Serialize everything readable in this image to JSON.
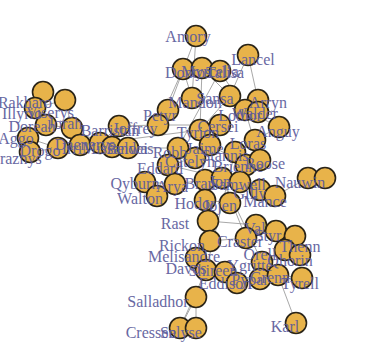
{
  "diagram": {
    "type": "network-graph",
    "node_fill": "#E8B34A",
    "node_stroke": "#2a2418",
    "label_color": "#5b5b9b",
    "edge_color": "#9a9a9a",
    "nodes": [
      {
        "id": "amory",
        "label": "Amory",
        "x": 196,
        "y": 36,
        "lx": 188,
        "ly": 38
      },
      {
        "id": "lancel",
        "label": "Lancel",
        "x": 248,
        "y": 55,
        "lx": 253,
        "ly": 61
      },
      {
        "id": "dontos",
        "label": "Dontos",
        "x": 183,
        "y": 69,
        "lx": 188,
        "ly": 74
      },
      {
        "id": "myrcella",
        "label": "Myrcella",
        "x": 202,
        "y": 68,
        "lx": 210,
        "ly": 73
      },
      {
        "id": "talisa",
        "label": "Talisa",
        "x": 220,
        "y": 71,
        "lx": 225,
        "ly": 74
      },
      {
        "id": "arryn",
        "label": "Arryn",
        "x": 258,
        "y": 100,
        "lx": 268,
        "ly": 104
      },
      {
        "id": "sansa",
        "label": "Sansa",
        "x": 230,
        "y": 96,
        "lx": 215,
        "ly": 100
      },
      {
        "id": "mandon",
        "label": "Mandon",
        "x": 192,
        "y": 98,
        "lx": 195,
        "ly": 104
      },
      {
        "id": "walder",
        "label": "Walder",
        "x": 245,
        "y": 110,
        "lx": 255,
        "ly": 115
      },
      {
        "id": "lothor",
        "label": "Lothor",
        "x": 258,
        "y": 112,
        "lx": 240,
        "ly": 117
      },
      {
        "id": "anguy",
        "label": "Anguy",
        "x": 279,
        "y": 127,
        "lx": 278,
        "ly": 133
      },
      {
        "id": "petyr",
        "label": "Petyr",
        "x": 168,
        "y": 110,
        "lx": 160,
        "ly": 117
      },
      {
        "id": "joffrey",
        "label": "Joffrey",
        "x": 158,
        "y": 125,
        "lx": 135,
        "ly": 130
      },
      {
        "id": "tyrion",
        "label": "Tyrion",
        "x": 200,
        "y": 130,
        "lx": 198,
        "ly": 134
      },
      {
        "id": "cersei",
        "label": "Cersei",
        "x": 220,
        "y": 125,
        "lx": 218,
        "ly": 128
      },
      {
        "id": "jaime",
        "label": "Jaime",
        "x": 210,
        "y": 145,
        "lx": 205,
        "ly": 150
      },
      {
        "id": "rakharo",
        "label": "Rakharo",
        "x": 43,
        "y": 92,
        "lx": 25,
        "ly": 104
      },
      {
        "id": "illyrio",
        "label": "Illyrio",
        "x": 35,
        "y": 108,
        "lx": 22,
        "ly": 115
      },
      {
        "id": "viserys",
        "label": "Viserys",
        "x": 65,
        "y": 100,
        "lx": 50,
        "ly": 114
      },
      {
        "id": "doreah",
        "label": "Doreah",
        "x": 46,
        "y": 125,
        "lx": 32,
        "ly": 128
      },
      {
        "id": "aggo",
        "label": "Aggo",
        "x": 28,
        "y": 138,
        "lx": 16,
        "ly": 140
      },
      {
        "id": "jorah",
        "label": "Jorah",
        "x": 72,
        "y": 128,
        "lx": 65,
        "ly": 125
      },
      {
        "id": "drogo",
        "label": "Drogo",
        "x": 58,
        "y": 148,
        "lx": 40,
        "ly": 152
      },
      {
        "id": "kraznys",
        "label": "Kraznys",
        "x": 30,
        "y": 152,
        "lx": 15,
        "ly": 160
      },
      {
        "id": "irri",
        "label": "Irri",
        "x": 80,
        "y": 145,
        "lx": 72,
        "ly": 150
      },
      {
        "id": "daenerys",
        "label": "Daenerys",
        "x": 100,
        "y": 143,
        "lx": 85,
        "ly": 146
      },
      {
        "id": "barristan",
        "label": "Barristan",
        "x": 119,
        "y": 126,
        "lx": 110,
        "ly": 132
      },
      {
        "id": "missandei",
        "label": "Missandei",
        "x": 112,
        "y": 147,
        "lx": 115,
        "ly": 150
      },
      {
        "id": "belwas",
        "label": "Belwas",
        "x": 128,
        "y": 148,
        "lx": 130,
        "ly": 150
      },
      {
        "id": "robb",
        "label": "Robb",
        "x": 178,
        "y": 148,
        "lx": 170,
        "ly": 154
      },
      {
        "id": "catelyn",
        "label": "Catelyn",
        "x": 195,
        "y": 158,
        "lx": 190,
        "ly": 163
      },
      {
        "id": "ned",
        "label": "Eddard",
        "x": 168,
        "y": 165,
        "lx": 160,
        "ly": 170
      },
      {
        "id": "stannis",
        "label": "Stannis",
        "x": 235,
        "y": 152,
        "lx": 225,
        "ly": 157
      },
      {
        "id": "loras",
        "label": "Loras",
        "x": 255,
        "y": 140,
        "lx": 248,
        "ly": 145
      },
      {
        "id": "brienne",
        "label": "Brienne",
        "x": 246,
        "y": 165,
        "lx": 238,
        "ly": 168
      },
      {
        "id": "roose",
        "label": "Roose",
        "x": 260,
        "y": 160,
        "lx": 265,
        "ly": 165
      },
      {
        "id": "arya",
        "label": "Arya",
        "x": 175,
        "y": 184,
        "lx": 172,
        "ly": 188
      },
      {
        "id": "qyburn",
        "label": "Qyburn",
        "x": 145,
        "y": 182,
        "lx": 135,
        "ly": 185
      },
      {
        "id": "walton",
        "label": "Walton",
        "x": 157,
        "y": 196,
        "lx": 140,
        "ly": 200
      },
      {
        "id": "bran",
        "label": "Bran",
        "x": 205,
        "y": 180,
        "lx": 200,
        "ly": 185
      },
      {
        "id": "jon",
        "label": "Jon",
        "x": 222,
        "y": 178,
        "lx": 220,
        "ly": 183
      },
      {
        "id": "samwell",
        "label": "Samwell",
        "x": 240,
        "y": 182,
        "lx": 238,
        "ly": 186
      },
      {
        "id": "nauwin",
        "label": "Nauwin",
        "x": 308,
        "y": 178,
        "lx": 300,
        "ly": 184
      },
      {
        "id": "nl",
        "label": "N",
        "x": 325,
        "y": 178,
        "lx": 0,
        "ly": 0,
        "hidelabel": true
      },
      {
        "id": "gilly",
        "label": "Gilly",
        "x": 260,
        "y": 190,
        "lx": 250,
        "ly": 195
      },
      {
        "id": "mance",
        "label": "Mance",
        "x": 275,
        "y": 196,
        "lx": 265,
        "ly": 203
      },
      {
        "id": "hodor",
        "label": "Hodor",
        "x": 205,
        "y": 200,
        "lx": 195,
        "ly": 205
      },
      {
        "id": "jojen",
        "label": "Jojen",
        "x": 230,
        "y": 203,
        "lx": 220,
        "ly": 207
      },
      {
        "id": "rast",
        "label": "Rast",
        "x": 208,
        "y": 221,
        "lx": 175,
        "ly": 225
      },
      {
        "id": "val",
        "label": "Val",
        "x": 256,
        "y": 225,
        "lx": 255,
        "ly": 230
      },
      {
        "id": "rickon",
        "label": "Rickon",
        "x": 210,
        "y": 241,
        "lx": 182,
        "ly": 247
      },
      {
        "id": "craster",
        "label": "Craster",
        "x": 246,
        "y": 238,
        "lx": 240,
        "ly": 243
      },
      {
        "id": "styr",
        "label": "Styr",
        "x": 276,
        "y": 231,
        "lx": 268,
        "ly": 237
      },
      {
        "id": "thenn",
        "label": "Thenn",
        "x": 295,
        "y": 236,
        "lx": 300,
        "ly": 248
      },
      {
        "id": "orell",
        "label": "Orell",
        "x": 285,
        "y": 250,
        "lx": 260,
        "ly": 256
      },
      {
        "id": "ygritte",
        "label": "Ygritte",
        "x": 262,
        "y": 262,
        "lx": 250,
        "ly": 267
      },
      {
        "id": "qhorin",
        "label": "Qhorin",
        "x": 300,
        "y": 255,
        "lx": 290,
        "ly": 262
      },
      {
        "id": "melisandre",
        "label": "Melisandre",
        "x": 196,
        "y": 258,
        "lx": 184,
        "ly": 258
      },
      {
        "id": "davos",
        "label": "Davos",
        "x": 206,
        "y": 270,
        "lx": 186,
        "ly": 270
      },
      {
        "id": "shireen",
        "label": "Shireen",
        "x": 225,
        "y": 272,
        "lx": 213,
        "ly": 272
      },
      {
        "id": "eddison",
        "label": "Eddison",
        "x": 237,
        "y": 283,
        "lx": 225,
        "ly": 285
      },
      {
        "id": "pypar",
        "label": "Pypar",
        "x": 260,
        "y": 279,
        "lx": 250,
        "ly": 281
      },
      {
        "id": "grenn",
        "label": "Grenn",
        "x": 278,
        "y": 275,
        "lx": 270,
        "ly": 279
      },
      {
        "id": "tyrell",
        "label": "Tyrell",
        "x": 302,
        "y": 278,
        "lx": 300,
        "ly": 285
      },
      {
        "id": "salladhor",
        "label": "Salladhor",
        "x": 196,
        "y": 297,
        "lx": 158,
        "ly": 303
      },
      {
        "id": "cressen",
        "label": "Cressen",
        "x": 180,
        "y": 328,
        "lx": 151,
        "ly": 334
      },
      {
        "id": "selyse",
        "label": "Selyse",
        "x": 196,
        "y": 328,
        "lx": 181,
        "ly": 334
      },
      {
        "id": "karl",
        "label": "Karl",
        "x": 296,
        "y": 323,
        "lx": 285,
        "ly": 328
      }
    ],
    "edges": [
      [
        "amory",
        "mandon"
      ],
      [
        "amory",
        "petyr"
      ],
      [
        "lancel",
        "arryn"
      ],
      [
        "lancel",
        "sansa"
      ],
      [
        "dontos",
        "mandon"
      ],
      [
        "dontos",
        "joffrey"
      ],
      [
        "myrcella",
        "sansa"
      ],
      [
        "myrcella",
        "tyrion"
      ],
      [
        "talisa",
        "walder"
      ],
      [
        "talisa",
        "robb"
      ],
      [
        "rakharo",
        "viserys"
      ],
      [
        "illyrio",
        "viserys"
      ],
      [
        "viserys",
        "jorah"
      ],
      [
        "doreah",
        "jorah"
      ],
      [
        "aggo",
        "drogo"
      ],
      [
        "kraznys",
        "drogo"
      ],
      [
        "jorah",
        "daenerys"
      ],
      [
        "irri",
        "daenerys"
      ],
      [
        "daenerys",
        "barristan"
      ],
      [
        "daenerys",
        "missandei"
      ],
      [
        "missandei",
        "belwas"
      ],
      [
        "belwas",
        "robb"
      ],
      [
        "daenerys",
        "tyrion"
      ],
      [
        "barristan",
        "joffrey"
      ],
      [
        "robb",
        "catelyn"
      ],
      [
        "catelyn",
        "ned"
      ],
      [
        "ned",
        "arya"
      ],
      [
        "arya",
        "qyburn"
      ],
      [
        "qyburn",
        "walton"
      ],
      [
        "jaime",
        "brienne"
      ],
      [
        "stannis",
        "loras"
      ],
      [
        "roose",
        "walder"
      ],
      [
        "bran",
        "jon"
      ],
      [
        "jon",
        "samwell"
      ],
      [
        "samwell",
        "gilly"
      ],
      [
        "gilly",
        "mance"
      ],
      [
        "mance",
        "nauwin"
      ],
      [
        "nauwin",
        "nl"
      ],
      [
        "hodor",
        "jojen"
      ],
      [
        "rast",
        "val"
      ],
      [
        "rickon",
        "craster"
      ],
      [
        "styr",
        "thenn"
      ],
      [
        "orell",
        "ygritte"
      ],
      [
        "qhorin",
        "ygritte"
      ],
      [
        "melisandre",
        "davos"
      ],
      [
        "davos",
        "shireen"
      ],
      [
        "shireen",
        "eddison"
      ],
      [
        "pypar",
        "grenn"
      ],
      [
        "grenn",
        "tyrell"
      ],
      [
        "davos",
        "salladhor"
      ],
      [
        "salladhor",
        "cressen"
      ],
      [
        "salladhor",
        "selyse"
      ],
      [
        "cressen",
        "selyse"
      ],
      [
        "davos",
        "cressen"
      ],
      [
        "grenn",
        "karl"
      ],
      [
        "stannis",
        "davos"
      ],
      [
        "jon",
        "craster"
      ],
      [
        "jon",
        "ygritte"
      ],
      [
        "tyrion",
        "cersei"
      ],
      [
        "cersei",
        "jaime"
      ],
      [
        "tyrion",
        "sansa"
      ],
      [
        "joffrey",
        "cersei"
      ],
      [
        "ned",
        "jon"
      ],
      [
        "arya",
        "bran"
      ],
      [
        "walder",
        "anguy"
      ],
      [
        "anguy",
        "loras"
      ]
    ]
  }
}
